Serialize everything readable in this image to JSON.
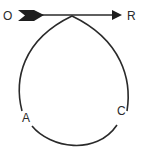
{
  "diagram": {
    "type": "path-loop",
    "labels": {
      "start": "O",
      "end": "R",
      "left_point": "A",
      "right_point": "C"
    },
    "colors": {
      "stroke": "#2a2a2a",
      "background": "#ffffff"
    },
    "arrow": {
      "from": "O",
      "to": "R",
      "tail": "fletching",
      "head": "triangle"
    }
  }
}
